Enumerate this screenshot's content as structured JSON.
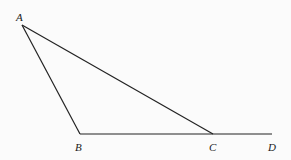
{
  "diagram": {
    "type": "geometry-triangle",
    "points": {
      "A": {
        "label": "A",
        "x": 22,
        "y": 25
      },
      "B": {
        "label": "B",
        "x": 80,
        "y": 134
      },
      "C": {
        "label": "C",
        "x": 213,
        "y": 134
      },
      "D": {
        "label": "D",
        "x": 272,
        "y": 134
      }
    },
    "segments": [
      [
        "A",
        "B"
      ],
      [
        "A",
        "C"
      ],
      [
        "B",
        "D"
      ]
    ],
    "stroke_color": "#222222"
  }
}
